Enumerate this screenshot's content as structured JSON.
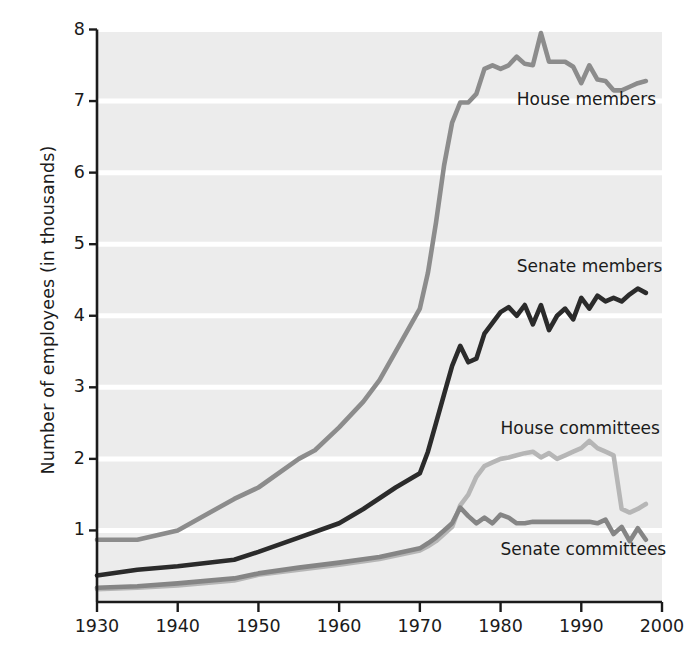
{
  "chart_data": {
    "type": "line",
    "title": "",
    "subtitle": "",
    "xlabel": "",
    "ylabel": "Number of employees (in thousands)",
    "xlim": [
      1930,
      2000
    ],
    "ylim": [
      0,
      8
    ],
    "xticks": [
      1930,
      1940,
      1950,
      1960,
      1970,
      1980,
      1990,
      2000
    ],
    "xtick_labels": [
      "1930",
      "1940",
      "1950",
      "1960",
      "1970",
      "1980",
      "1990",
      "2000"
    ],
    "yticks": [
      1,
      2,
      3,
      4,
      5,
      6,
      7,
      8
    ],
    "ytick_labels": [
      "1",
      "2",
      "3",
      "4",
      "5",
      "6",
      "7",
      "8"
    ],
    "grid": "horizontal-white-on-gray",
    "plot_background": "#ececec",
    "gridline_color": "#ffffff",
    "axis_color": "#1b1b1b",
    "legend_position": "inline-annotations",
    "series": [
      {
        "name": "House members",
        "color": "#8c8c8c",
        "label_x": 1982,
        "label_y": 7.02,
        "x": [
          1930,
          1935,
          1940,
          1947,
          1950,
          1955,
          1957,
          1960,
          1963,
          1965,
          1967,
          1970,
          1971,
          1972,
          1973,
          1974,
          1975,
          1976,
          1977,
          1978,
          1979,
          1980,
          1981,
          1982,
          1983,
          1984,
          1985,
          1986,
          1987,
          1988,
          1989,
          1990,
          1991,
          1992,
          1993,
          1994,
          1995,
          1996,
          1997,
          1998
        ],
        "y": [
          0.87,
          0.87,
          1.0,
          1.44,
          1.6,
          2.0,
          2.12,
          2.44,
          2.8,
          3.1,
          3.5,
          4.1,
          4.6,
          5.3,
          6.1,
          6.7,
          6.98,
          6.98,
          7.1,
          7.45,
          7.5,
          7.45,
          7.5,
          7.62,
          7.52,
          7.5,
          7.95,
          7.55,
          7.55,
          7.55,
          7.48,
          7.25,
          7.5,
          7.3,
          7.28,
          7.15,
          7.15,
          7.2,
          7.25,
          7.28
        ]
      },
      {
        "name": "Senate members",
        "color": "#2b2b2b",
        "label_x": 1982,
        "label_y": 4.68,
        "x": [
          1930,
          1935,
          1940,
          1947,
          1950,
          1955,
          1960,
          1963,
          1965,
          1967,
          1970,
          1971,
          1972,
          1973,
          1974,
          1975,
          1976,
          1977,
          1978,
          1979,
          1980,
          1981,
          1982,
          1983,
          1984,
          1985,
          1986,
          1987,
          1988,
          1989,
          1990,
          1991,
          1992,
          1993,
          1994,
          1995,
          1996,
          1997,
          1998
        ],
        "y": [
          0.37,
          0.45,
          0.5,
          0.59,
          0.7,
          0.9,
          1.1,
          1.3,
          1.45,
          1.6,
          1.8,
          2.1,
          2.5,
          2.9,
          3.3,
          3.58,
          3.35,
          3.4,
          3.75,
          3.9,
          4.05,
          4.12,
          4.0,
          4.15,
          3.88,
          4.15,
          3.8,
          4.0,
          4.1,
          3.95,
          4.25,
          4.1,
          4.28,
          4.2,
          4.25,
          4.2,
          4.3,
          4.38,
          4.32
        ]
      },
      {
        "name": "House committees",
        "color": "#b6b6b6",
        "label_x": 1980,
        "label_y": 2.42,
        "x": [
          1930,
          1935,
          1940,
          1947,
          1950,
          1955,
          1960,
          1965,
          1970,
          1971,
          1972,
          1973,
          1974,
          1975,
          1976,
          1977,
          1978,
          1979,
          1980,
          1981,
          1982,
          1983,
          1984,
          1985,
          1986,
          1987,
          1988,
          1989,
          1990,
          1991,
          1992,
          1993,
          1994,
          1995,
          1996,
          1997,
          1998
        ],
        "y": [
          0.18,
          0.2,
          0.23,
          0.3,
          0.38,
          0.45,
          0.52,
          0.6,
          0.72,
          0.78,
          0.85,
          0.95,
          1.05,
          1.35,
          1.5,
          1.75,
          1.9,
          1.95,
          2.0,
          2.02,
          2.05,
          2.08,
          2.1,
          2.02,
          2.08,
          2.0,
          2.05,
          2.1,
          2.15,
          2.25,
          2.15,
          2.1,
          2.05,
          1.3,
          1.25,
          1.3,
          1.37
        ]
      },
      {
        "name": "Senate committees",
        "color": "#858585",
        "label_x": 1980,
        "label_y": 0.72,
        "x": [
          1930,
          1935,
          1940,
          1947,
          1950,
          1955,
          1960,
          1965,
          1970,
          1971,
          1972,
          1973,
          1974,
          1975,
          1976,
          1977,
          1978,
          1979,
          1980,
          1981,
          1982,
          1983,
          1984,
          1985,
          1986,
          1987,
          1988,
          1989,
          1990,
          1991,
          1992,
          1993,
          1994,
          1995,
          1996,
          1997,
          1998
        ],
        "y": [
          0.2,
          0.22,
          0.26,
          0.33,
          0.4,
          0.48,
          0.55,
          0.63,
          0.75,
          0.82,
          0.9,
          1.0,
          1.1,
          1.32,
          1.2,
          1.1,
          1.18,
          1.1,
          1.22,
          1.18,
          1.1,
          1.1,
          1.12,
          1.12,
          1.12,
          1.12,
          1.12,
          1.12,
          1.12,
          1.12,
          1.1,
          1.15,
          0.95,
          1.05,
          0.85,
          1.03,
          0.87
        ]
      }
    ]
  }
}
